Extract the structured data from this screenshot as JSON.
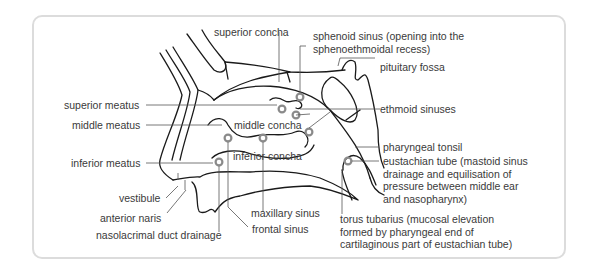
{
  "diagram": {
    "type": "anatomical-cross-section",
    "colors": {
      "line": "#1a1a1a",
      "ring": "#8a8a8a",
      "leader": "#555555",
      "frame": "#dcdcdc"
    },
    "labels": {
      "superior_concha": "superior concha",
      "sphenoid_sinus": "sphenoid sinus (opening into the\nsphenoethmoidal recess)",
      "pituitary_fossa": "pituitary fossa",
      "superior_meatus": "superior meatus",
      "ethmoid_sinuses": "ethmoid sinuses",
      "middle_meatus": "middle meatus",
      "middle_concha": "middle concha",
      "pharyngeal_tonsil": "pharyngeal tonsil",
      "inferior_concha": "inferior concha",
      "inferior_meatus": "inferior meatus",
      "eustachian_tube": "eustachian tube (mastoid sinus\ndrainage and equilisation of\npressure between middle ear\nand nasopharynx)",
      "vestibule": "vestibule",
      "anterior_naris": "anterior naris",
      "maxillary_sinus": "maxillary sinus",
      "frontal_sinus": "frontal sinus",
      "nasolacrimal_duct": "nasolacrimal duct drainage",
      "torus_tubarius": "torus tubarius (mucosal elevation\nformed by pharyngeal end of\ncartilaginous part of eustachian tube)"
    }
  }
}
